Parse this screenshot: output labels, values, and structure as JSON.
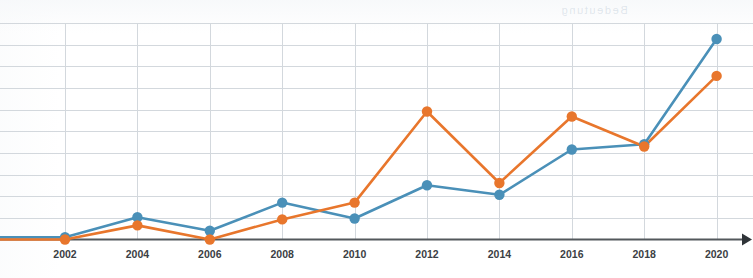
{
  "chart_data": {
    "type": "line",
    "title": "",
    "subtitle": "",
    "xlabel": "",
    "ylabel": "",
    "categories": [
      2002,
      2004,
      2006,
      2008,
      2010,
      2012,
      2014,
      2016,
      2018,
      2020
    ],
    "tick_labels": [
      "2002",
      "2004",
      "2006",
      "2008",
      "2010",
      "2012",
      "2014",
      "2016",
      "2018",
      "2020"
    ],
    "xlim": [
      2001,
      2021
    ],
    "ylim": [
      0,
      8.8
    ],
    "grid": {
      "horizontal": true,
      "vertical": true,
      "horizontal_levels": [
        0.95,
        1.9,
        2.85,
        3.8,
        4.75,
        5.7,
        6.65,
        7.6,
        8.55
      ],
      "color": "#d3d8dd"
    },
    "legend": {
      "visible": false,
      "position": "none"
    },
    "axis": {
      "baseline_color": "#53585c",
      "arrow_right": true,
      "y_axis_visible": false
    },
    "marker": {
      "shape": "circle",
      "radius": 5.2
    },
    "line_width": 2.6,
    "series": [
      {
        "name": "series-blue",
        "color": "#4a90b8",
        "values": [
          0.1,
          0.98,
          0.38,
          1.62,
          0.92,
          2.38,
          1.96,
          3.95,
          4.18,
          8.8
        ]
      },
      {
        "name": "series-orange",
        "color": "#e8762c",
        "values": [
          0.0,
          0.62,
          0.0,
          0.88,
          1.62,
          5.62,
          2.48,
          5.4,
          4.08,
          7.18
        ]
      }
    ],
    "leading_segment": {
      "description": "both series run flat from the left edge into the 2002 point",
      "x_start": 0,
      "blue_value": 0.1,
      "orange_value": 0.0
    }
  },
  "ghost_artifact": {
    "text": "Bedeutung"
  }
}
